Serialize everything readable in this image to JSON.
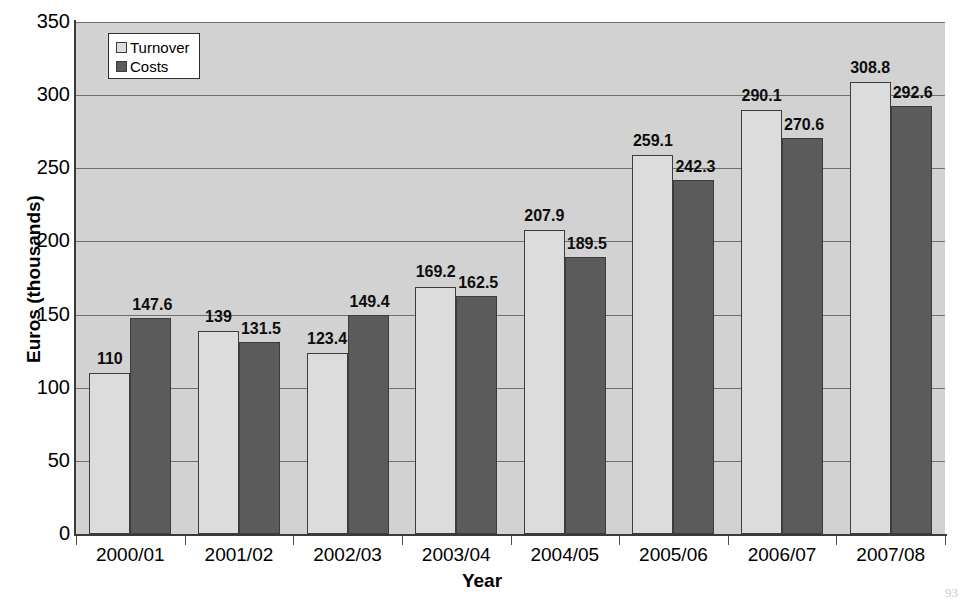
{
  "chart_data": {
    "type": "bar",
    "title": "",
    "xlabel": "Year",
    "ylabel": "Euros (thousands)",
    "categories": [
      "2000/01",
      "2001/02",
      "2002/03",
      "2003/04",
      "2004/05",
      "2005/06",
      "2006/07",
      "2007/08"
    ],
    "series": [
      {
        "name": "Turnover",
        "color": "#dcdcdc",
        "values": [
          110,
          139,
          123.4,
          169.2,
          207.9,
          259.1,
          290.1,
          308.8
        ],
        "labels": [
          "110",
          "139",
          "123.4",
          "169.2",
          "207.9",
          "259.1",
          "290.1",
          "308.8"
        ]
      },
      {
        "name": "Costs",
        "color": "#5b5b5b",
        "values": [
          147.6,
          131.5,
          149.4,
          162.5,
          189.5,
          242.3,
          270.6,
          292.6
        ],
        "labels": [
          "147.6",
          "131.5",
          "149.4",
          "162.5",
          "189.5",
          "242.3",
          "270.6",
          "292.6"
        ]
      }
    ],
    "ylim": [
      0,
      350
    ],
    "yticks": [
      0,
      50,
      100,
      150,
      200,
      250,
      300,
      350
    ],
    "ytick_labels": [
      "0",
      "50",
      "100",
      "150",
      "200",
      "250",
      "300",
      "350"
    ],
    "grid": true,
    "legend_position": "top-left",
    "plot_background": "#d2d2d2"
  },
  "legend": {
    "items": [
      {
        "label": "Turnover"
      },
      {
        "label": "Costs"
      }
    ]
  },
  "artifact": {
    "text": "93"
  }
}
